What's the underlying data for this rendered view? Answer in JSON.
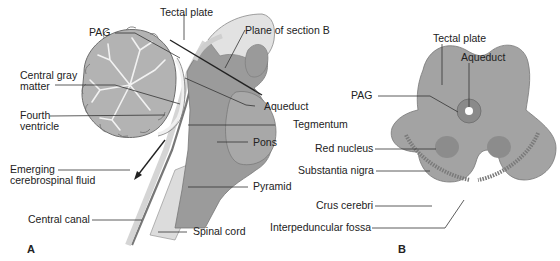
{
  "figure": {
    "panel_a": {
      "letter": "A",
      "title": "Midsagittal section of brainstem and cerebellum",
      "labels": {
        "tectal_plate": "Tectal plate",
        "pag": "PAG",
        "plane_of_section": "Plane of section B",
        "central_gray_line1": "Central gray",
        "central_gray_line2": "matter",
        "fourth_ventricle_line1": "Fourth",
        "fourth_ventricle_line2": "ventricle",
        "aqueduct": "Aqueduct",
        "tegmentum": "Tegmentum",
        "pons": "Pons",
        "emerging_line1": "Emerging",
        "emerging_line2": "cerebrospinal fluid",
        "pyramid": "Pyramid",
        "central_canal": "Central canal",
        "spinal_cord": "Spinal cord"
      }
    },
    "panel_b": {
      "letter": "B",
      "title": "Transverse section of midbrain",
      "labels": {
        "tectal_plate": "Tectal plate",
        "aqueduct": "Aqueduct",
        "pag": "PAG",
        "red_nucleus": "Red nucleus",
        "substantia_nigra": "Substantia nigra",
        "crus_cerebri": "Crus cerebri",
        "interpeduncular_fossa": "Interpeduncular fossa"
      }
    }
  },
  "colors": {
    "background": "#ffffff",
    "brainstem_gray": "#9a9a9a",
    "midbrain_gray": "#a3a3a3",
    "dark_gray": "#7d7d7d",
    "light_gray": "#d8d8d8",
    "cerebellum": "#b5b5b5",
    "leader_line": "#333333"
  }
}
